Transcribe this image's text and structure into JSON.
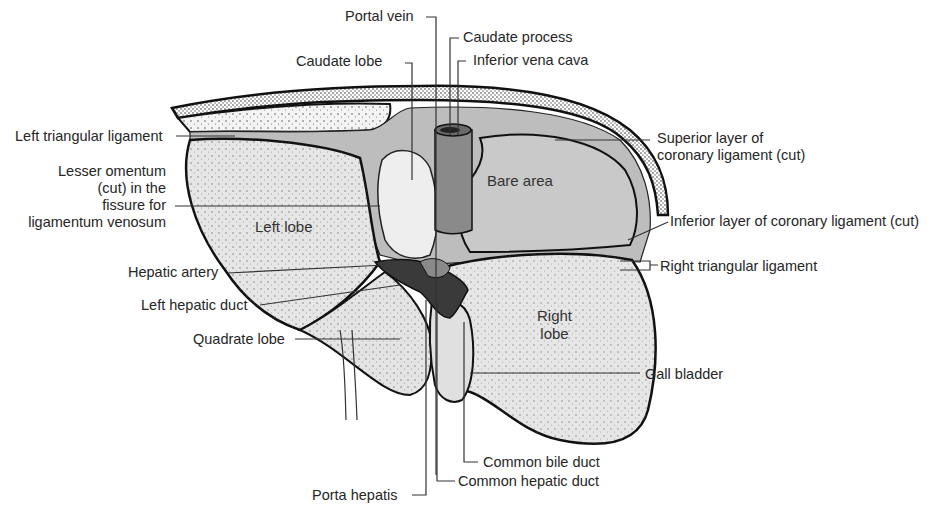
{
  "figure": {
    "colors": {
      "liver_fill": "#e6e6e6",
      "peritoneal_fill": "#bdbdbd",
      "bare_area_fill": "#c9c9c9",
      "vena_cava_fill": "#8a8a8a",
      "hilum_dark": "#3a3a3a",
      "outline": "#111111",
      "leader_line": "#333333"
    },
    "region_labels": {
      "left_lobe": "Left lobe",
      "bare_area": "Bare area",
      "right_lobe_line1": "Right",
      "right_lobe_line2": "lobe"
    },
    "callouts": {
      "portal_vein": "Portal vein",
      "caudate_process": "Caudate process",
      "caudate_lobe": "Caudate lobe",
      "inferior_vena_cava": "Inferior vena cava",
      "left_triangular_ligament": "Left triangular ligament",
      "lesser_omentum_1": "Lesser omentum",
      "lesser_omentum_2": "(cut) in the",
      "lesser_omentum_3": "fissure for",
      "lesser_omentum_4": "ligamentum venosum",
      "superior_coronary_1": "Superior layer of",
      "superior_coronary_2": "coronary ligament (cut)",
      "inferior_coronary": "Inferior layer of coronary ligament (cut)",
      "right_triangular_ligament": "Right triangular ligament",
      "hepatic_artery": "Hepatic artery",
      "left_hepatic_duct": "Left hepatic duct",
      "quadrate_lobe": "Quadrate lobe",
      "gall_bladder": "Gall bladder",
      "common_bile_duct": "Common bile duct",
      "common_hepatic_duct": "Common hepatic duct",
      "porta_hepatis": "Porta hepatis"
    }
  }
}
